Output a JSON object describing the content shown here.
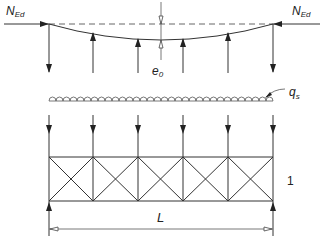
{
  "figure": {
    "type": "structural-diagram"
  },
  "labels": {
    "axial_force_left": {
      "main": "N",
      "sub": "Ed"
    },
    "axial_force_right": {
      "main": "N",
      "sub": "Ed"
    },
    "initial_bow": {
      "main": "e",
      "sub": "0"
    },
    "stabilizing_load": {
      "main": "q",
      "sub": "s"
    },
    "span": "L",
    "bracing_system_ref": "1"
  },
  "geometry": {
    "node_x": [
      49,
      93,
      138,
      183,
      228,
      273
    ],
    "top_line_y": 24,
    "bow_max_y": 40,
    "scallop_baseline_y": 101,
    "truss_top_y": 157,
    "truss_bottom_y": 201,
    "dimension_y": 229
  },
  "colors": {
    "line": "#333333",
    "background": "#ffffff"
  }
}
